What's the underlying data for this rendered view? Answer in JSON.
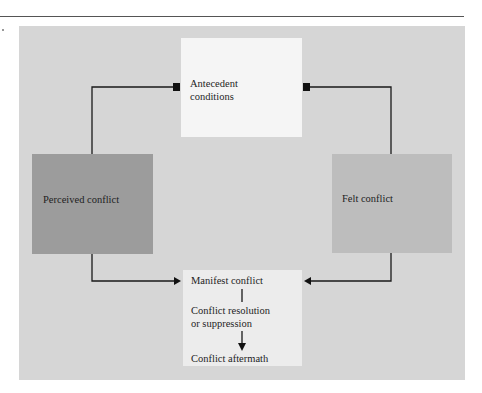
{
  "diagram": {
    "type": "flow",
    "nodes": {
      "antecedent": {
        "label_line1": "Antecedent",
        "label_line2": "conditions",
        "color": "#f5f5f5"
      },
      "perceived": {
        "label": "Perceived conflict",
        "color": "#9c9c9c"
      },
      "felt": {
        "label": "Felt conflict",
        "color": "#bdbdbd"
      },
      "outcome": {
        "manifest": "Manifest conflict",
        "resolution_line1": "Conflict resolution",
        "resolution_line2": "or suppression",
        "aftermath": "Conflict aftermath",
        "color": "#ececec"
      }
    },
    "edges": [
      {
        "from": "antecedent",
        "to": "perceived",
        "style": "square-start"
      },
      {
        "from": "antecedent",
        "to": "felt",
        "style": "square-start"
      },
      {
        "from": "perceived",
        "to": "manifest",
        "style": "arrow"
      },
      {
        "from": "felt",
        "to": "manifest",
        "style": "arrow"
      },
      {
        "from": "manifest",
        "to": "resolution",
        "style": "line"
      },
      {
        "from": "resolution",
        "to": "aftermath",
        "style": "arrow"
      }
    ],
    "panel_color": "#d6d6d6"
  }
}
